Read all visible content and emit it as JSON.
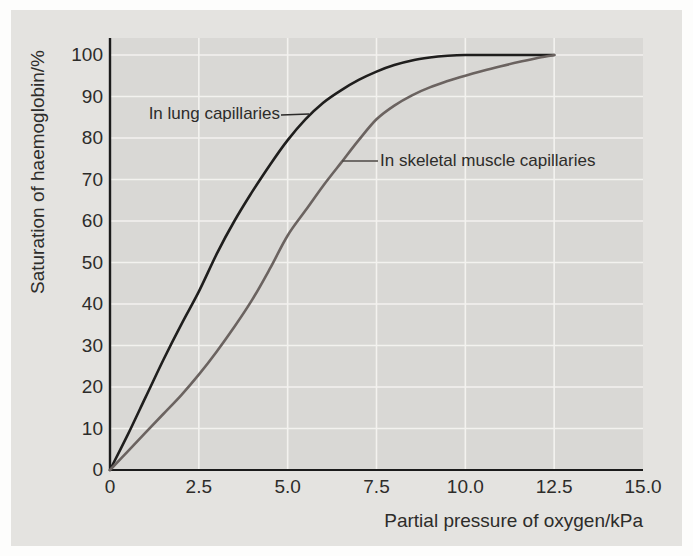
{
  "figure": {
    "background_color": "#e4e3e0",
    "plot_background_color": "#d9d8d5",
    "gridline_color": "#f3f2ef",
    "axis_color": "#1b1b1b",
    "text_color": "#2d2c2a"
  },
  "chart_data": {
    "type": "line",
    "title": "",
    "xlabel": "Partial pressure of oxygen/kPa",
    "ylabel": "Saturation of haemoglobin/%",
    "xlim": [
      0,
      15
    ],
    "ylim": [
      0,
      100
    ],
    "grid": true,
    "x_gridlines": [
      2.5,
      5,
      7.5,
      10,
      12.5
    ],
    "y_gridlines": [
      10,
      20,
      30,
      40,
      50,
      60,
      70,
      80,
      90,
      100
    ],
    "x_ticks": [
      {
        "value": 0,
        "label": "0"
      },
      {
        "value": 2.5,
        "label": "2.5"
      },
      {
        "value": 5,
        "label": "5.0"
      },
      {
        "value": 7.5,
        "label": "7.5"
      },
      {
        "value": 10,
        "label": "10.0"
      },
      {
        "value": 12.5,
        "label": "12.5"
      },
      {
        "value": 15,
        "label": "15.0"
      }
    ],
    "y_ticks": [
      {
        "value": 0,
        "label": "0"
      },
      {
        "value": 10,
        "label": "10"
      },
      {
        "value": 20,
        "label": "20"
      },
      {
        "value": 30,
        "label": "30"
      },
      {
        "value": 40,
        "label": "40"
      },
      {
        "value": 50,
        "label": "50"
      },
      {
        "value": 60,
        "label": "60"
      },
      {
        "value": 70,
        "label": "70"
      },
      {
        "value": 80,
        "label": "80"
      },
      {
        "value": 90,
        "label": "90"
      },
      {
        "value": 100,
        "label": "100"
      }
    ],
    "series": [
      {
        "name": "In lung capillaries",
        "data_name": "lung-capillaries-curve",
        "color": "#1f1e1d",
        "x": [
          0,
          0.5,
          1,
          1.5,
          2,
          2.5,
          3,
          3.5,
          4,
          4.5,
          5,
          5.5,
          6,
          6.5,
          7,
          7.5,
          8,
          8.5,
          9,
          9.5,
          10,
          10.5,
          11,
          11.5,
          12,
          12.5
        ],
        "y": [
          0,
          8.5,
          17.5,
          26.5,
          35,
          43,
          52,
          60,
          67,
          73.5,
          79.5,
          84.5,
          88.5,
          91.5,
          94,
          96,
          97.6,
          98.7,
          99.4,
          99.8,
          100,
          100,
          100,
          100,
          100,
          100
        ]
      },
      {
        "name": "In skeletal muscle capillaries",
        "data_name": "skeletal-muscle-capillaries-curve",
        "color": "#6b6360",
        "x": [
          0,
          0.5,
          1,
          1.5,
          2,
          2.5,
          3,
          3.5,
          4,
          4.5,
          5,
          5.5,
          6,
          6.5,
          7,
          7.5,
          8,
          8.5,
          9,
          9.5,
          10,
          10.5,
          11,
          11.5,
          12,
          12.5
        ],
        "y": [
          0,
          4.5,
          9,
          13.5,
          18,
          23,
          28.5,
          34.5,
          41,
          48.5,
          56.5,
          62.5,
          68.5,
          74,
          79.5,
          84.5,
          87.8,
          90.3,
          92.2,
          93.7,
          95,
          96.2,
          97.3,
          98.3,
          99.2,
          100
        ]
      }
    ],
    "annotations": [
      {
        "label": "In lung capillaries",
        "series": "In lung capillaries"
      },
      {
        "label": "In skeletal muscle capillaries",
        "series": "In skeletal muscle capillaries"
      }
    ]
  }
}
